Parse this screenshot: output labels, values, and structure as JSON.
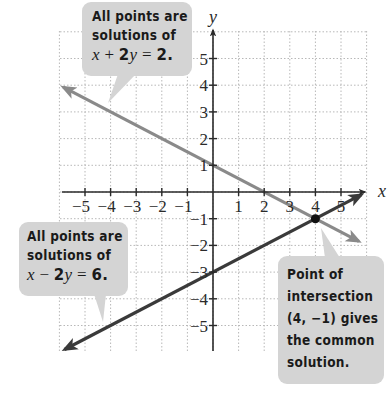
{
  "chart_data": {
    "type": "line",
    "title": "",
    "xlabel": "x",
    "ylabel": "y",
    "xlim": [
      -6,
      6
    ],
    "ylim": [
      -6,
      6
    ],
    "grid": true,
    "x_ticks": [
      -5,
      -4,
      -3,
      -2,
      -1,
      1,
      2,
      3,
      4,
      5
    ],
    "y_ticks": [
      5,
      4,
      3,
      2,
      1,
      -1,
      -2,
      -3,
      -4,
      -5
    ],
    "series": [
      {
        "name": "x + 2y = 2",
        "equation": "x + 2y = 2",
        "color": "#8a8a8a",
        "x": [
          -6,
          6
        ],
        "y": [
          4,
          -2
        ],
        "y_intercept": 1,
        "x_intercept": 2
      },
      {
        "name": "x - 2y = 6",
        "equation": "x - 2y = 6",
        "color": "#3a3a3a",
        "x": [
          -6,
          6
        ],
        "y": [
          -6,
          0
        ],
        "y_intercept": -3,
        "x_intercept": 6
      }
    ],
    "points": [
      {
        "label": "intersection",
        "x": 4,
        "y": -1
      }
    ],
    "annotations": [
      "All points are solutions of x + 2y = 2.",
      "All points are solutions of x − 2y = 6.",
      "Point of intersection (4, −1) gives the common solution."
    ]
  },
  "axes": {
    "x_label": "x",
    "y_label": "y",
    "x_tick_labels": [
      "−5",
      "−4",
      "−3",
      "−2",
      "−1",
      "1",
      "2",
      "3",
      "4",
      "5"
    ],
    "y_tick_labels": [
      "5",
      "4",
      "3",
      "2",
      "1",
      "−1",
      "−2",
      "−3",
      "−4",
      "−5"
    ]
  },
  "callouts": {
    "top": {
      "line1": "All points are",
      "line2": "solutions of",
      "eq_x": "x",
      "eq_op": " + ",
      "eq_coef": "2",
      "eq_y": "y",
      "eq_rest": " = ",
      "eq_val": "2."
    },
    "left": {
      "line1": "All points are",
      "line2": "solutions of",
      "eq_x": "x",
      "eq_op": " − ",
      "eq_coef": "2",
      "eq_y": "y",
      "eq_rest": " = ",
      "eq_val": "6."
    },
    "right": {
      "line1": "Point of",
      "line2": "intersection",
      "line3": "(4, −1) gives",
      "line4": "the common",
      "line5": "solution."
    }
  },
  "colors": {
    "line1": "#8a8a8a",
    "line2": "#3a3a3a",
    "axis": "#2a2a2a",
    "grid": "#b8b8b8",
    "callout_bg": "#d4d4d4"
  }
}
